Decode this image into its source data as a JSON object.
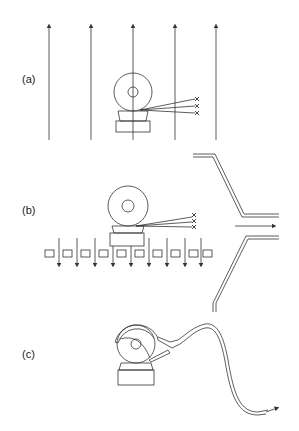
{
  "figure": {
    "panels": [
      {
        "id": "a",
        "label": "(a)",
        "description": "Grinding wheel on workpiece with vertical upward airflow lines; sparks/particles marked with x"
      },
      {
        "id": "b",
        "label": "(b)",
        "description": "Grinding wheel over perforated table with downward airflow through grid and lateral extraction duct"
      },
      {
        "id": "c",
        "label": "(c)",
        "description": "Grinding wheel with hood and nozzle connected to flexible extraction hose"
      }
    ],
    "markers": [
      "x",
      "x",
      "x"
    ],
    "colors": {
      "line": "#333333",
      "background": "#ffffff"
    }
  }
}
